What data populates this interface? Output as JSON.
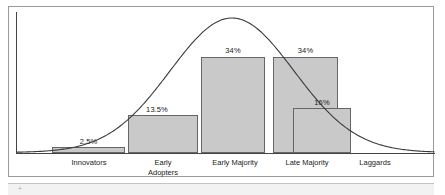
{
  "figure": {
    "name": "diffusion-of-innovations-adoption-curve",
    "frame_color": "#9a9a9a",
    "axis_color": "#444444",
    "bar_fill": "#c9c9c9",
    "bar_stroke": "#666666",
    "curve_color": "#3a3a3a",
    "band_color": "#f2f2f2",
    "band_mark": "+"
  },
  "chart_data": {
    "type": "bar",
    "title": "",
    "subtitle": "",
    "xlabel": "",
    "ylabel": "",
    "grid": false,
    "legend": "none",
    "categories": [
      "Innovators",
      "Early\nAdopters",
      "Early Majority",
      "Late Majority",
      "Laggards"
    ],
    "values": [
      2.5,
      13.5,
      34,
      34,
      16
    ],
    "value_labels": [
      "2.5%",
      "13.5%",
      "34%",
      "34%",
      "16%"
    ],
    "ylim": [
      0,
      38
    ],
    "overlay": {
      "type": "line",
      "name": "normal-distribution-bell-curve",
      "description": "bell curve"
    }
  },
  "bars": [
    {
      "category": "Innovators",
      "label": "2.5%",
      "left": 52,
      "width": 73,
      "top": 147,
      "height": 6,
      "label_left": 52,
      "label_width": 73,
      "label_top": 137
    },
    {
      "category": "Early Adopters",
      "label": "13.5%",
      "left": 128,
      "width": 70,
      "top": 115,
      "height": 38,
      "label_left": 122,
      "label_width": 70,
      "label_top": 105
    },
    {
      "category": "Early Majority",
      "label": "34%",
      "left": 201,
      "width": 64,
      "top": 57,
      "height": 96,
      "label_left": 201,
      "label_width": 64,
      "label_top": 46
    },
    {
      "category": "Late Majority",
      "label": "34%",
      "left": 273,
      "width": 65,
      "top": 57,
      "height": 96,
      "label_left": 273,
      "label_width": 65,
      "label_top": 46
    },
    {
      "category": "Laggards",
      "label": "16%",
      "left": 293,
      "width": 58,
      "top": 108,
      "height": 45,
      "label_left": 293,
      "label_width": 58,
      "label_top": 98
    }
  ],
  "category_labels": [
    {
      "text": "Innovators",
      "left": 46,
      "width": 86,
      "top": 158
    },
    {
      "text": "Early\nAdopters",
      "left": 125,
      "width": 76,
      "top": 158
    },
    {
      "text": "Early Majority",
      "left": 196,
      "width": 78,
      "top": 158
    },
    {
      "text": "Late Majority",
      "left": 268,
      "width": 78,
      "top": 158
    },
    {
      "text": "Laggards",
      "left": 340,
      "width": 70,
      "top": 158
    }
  ]
}
